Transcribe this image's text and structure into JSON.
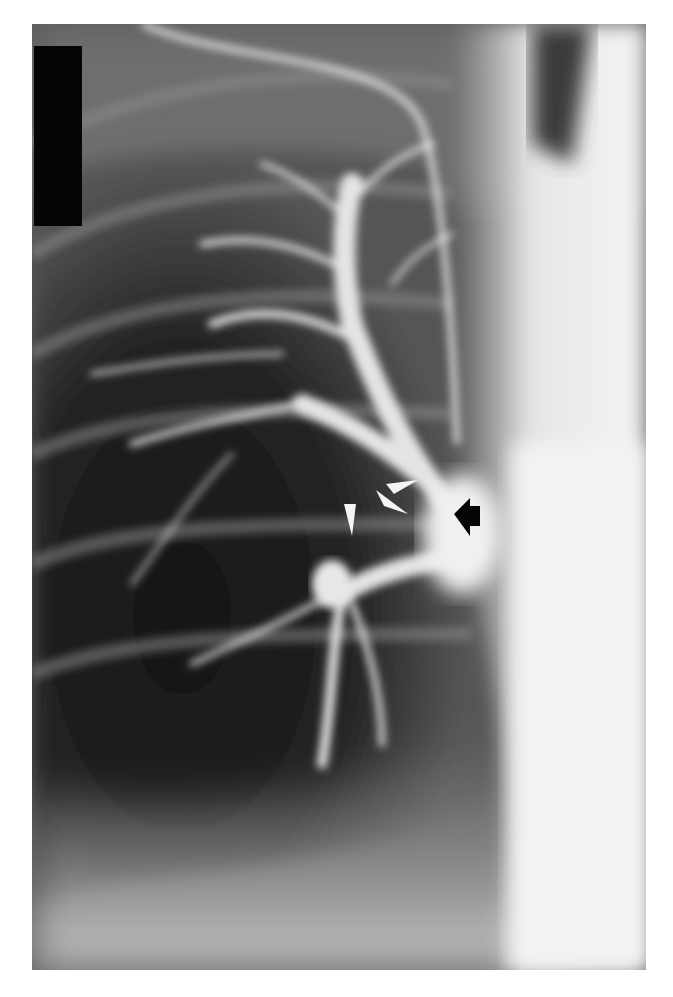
{
  "image": {
    "type": "radiograph",
    "modality": "pulmonary angiogram",
    "view": "frontal",
    "background_color": "#ffffff",
    "film_bounds": {
      "x": 32,
      "y": 24,
      "width": 614,
      "height": 946
    }
  },
  "annotations": {
    "white_arrowheads": [
      {
        "tip": [
          386,
          484
        ],
        "direction": "left"
      },
      {
        "tip": [
          378,
          473
        ],
        "direction": "up-left"
      },
      {
        "tip": [
          352,
          534
        ],
        "direction": "down"
      }
    ],
    "black_arrow": {
      "tip": [
        454,
        510
      ],
      "direction": "left",
      "color": "#000000"
    },
    "redaction_block": {
      "x": 34,
      "y": 46,
      "width": 48,
      "height": 180,
      "color": "#050505"
    }
  },
  "colors": {
    "lung_dark": "#1a1a1a",
    "mediastinum": "#f2f2f2",
    "vessel": "#e8e8e8",
    "arrowhead_white": "#f4f4f4"
  }
}
